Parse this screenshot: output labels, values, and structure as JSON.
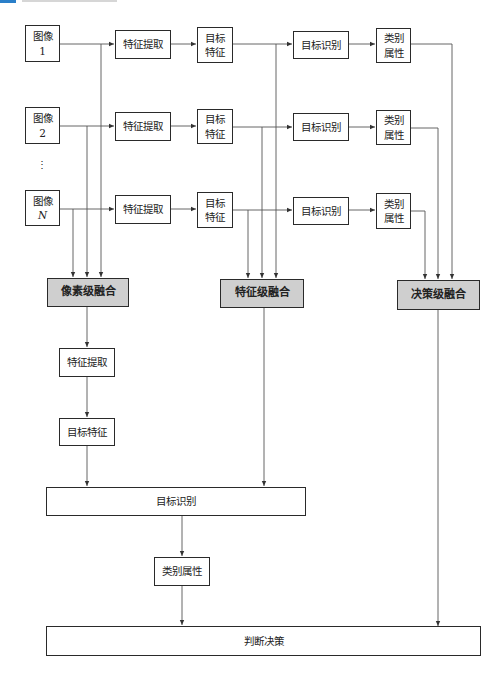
{
  "header": {
    "accent_color": "#2a7fc9"
  },
  "inputs": [
    {
      "label": "图像",
      "index": "1"
    },
    {
      "label": "图像",
      "index": "2"
    },
    {
      "label": "图像",
      "index": "N"
    }
  ],
  "ellipsis": "⋮",
  "rows": {
    "feature_extraction": "特征提取",
    "target_feature": "目标\n特征",
    "target_recognition": "目标识别",
    "class_attribute": "类别\n属性"
  },
  "fusion": {
    "pixel_level": "像素级融合",
    "feature_level": "特征级融合",
    "decision_level": "决策级融合"
  },
  "pipeline": {
    "feature_extraction": "特征提取",
    "target_feature": "目标特征",
    "target_recognition": "目标识别",
    "class_attribute": "类别属性",
    "final_decision": "判断决策"
  },
  "colors": {
    "fusion_fill": "#cfcfcf",
    "line": "#555555",
    "border": "#2a2a2a"
  }
}
